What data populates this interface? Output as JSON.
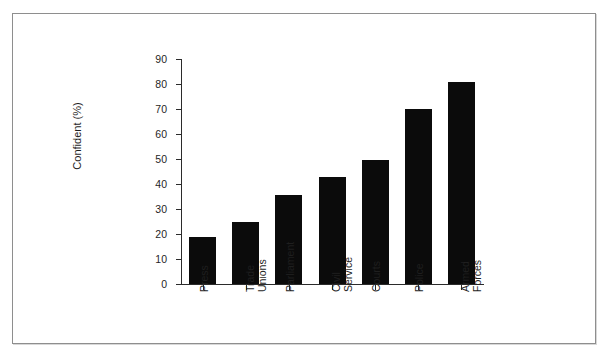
{
  "figure": {
    "border_color": "#8e8e8e",
    "background": "#ffffff"
  },
  "chart_data": {
    "type": "bar",
    "title": "",
    "xlabel": "",
    "ylabel": "Confident (%)",
    "ylim": [
      0,
      90
    ],
    "ytick_step": 10,
    "yticks": [
      "90",
      "80",
      "70",
      "60",
      "50",
      "40",
      "30",
      "20",
      "10",
      "0"
    ],
    "grid": false,
    "legend": false,
    "bar_color": "#0b0b0b",
    "categories": [
      "Press",
      "Trade\nUnions",
      "Parliament",
      "Civil\nService",
      "Courts",
      "Police",
      "Armed\nForces"
    ],
    "values": [
      19,
      25,
      35.5,
      43,
      49.5,
      70,
      81
    ]
  }
}
